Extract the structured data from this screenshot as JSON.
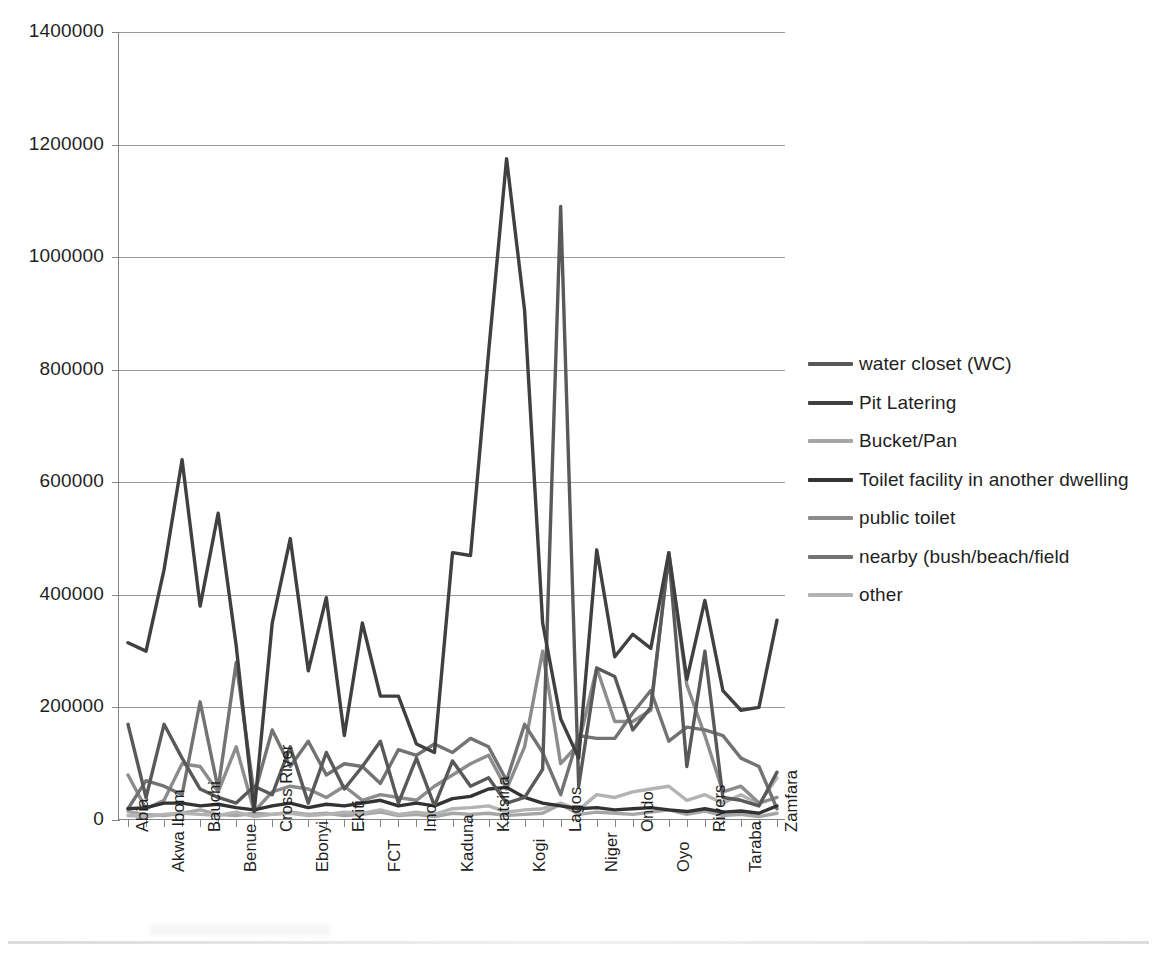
{
  "chart_data": {
    "type": "line",
    "title": "",
    "subtitle": "",
    "xlabel": "",
    "ylabel": "",
    "ylim": [
      0,
      1400000
    ],
    "ytick_labels": [
      "0",
      "200000",
      "400000",
      "600000",
      "800000",
      "1000000",
      "1200000",
      "1400000"
    ],
    "ytick_values": [
      0,
      200000,
      400000,
      600000,
      800000,
      1000000,
      1200000,
      1400000
    ],
    "grid": "horizontal",
    "legend_position": "right",
    "categories": [
      "Abia",
      "Adamawa",
      "Akwa Ibom",
      "Anambra",
      "Bauchi",
      "Bayelsa",
      "Benue",
      "Borno",
      "Cross River",
      "Delta",
      "Ebonyi",
      "Edo",
      "Ekiti",
      "Enugu",
      "FCT",
      "Gombe",
      "Imo",
      "Jigawa",
      "Kaduna",
      "Kano",
      "Katsina",
      "Kebbi",
      "Kogi",
      "Kwara",
      "Lagos",
      "Nasarawa",
      "Niger",
      "Ogun",
      "Ondo",
      "Osun",
      "Oyo",
      "Plateau",
      "Rivers",
      "Sokoto",
      "Taraba",
      "Yobe",
      "Zamfara"
    ],
    "tick_label_categories": [
      "Abia",
      "Akwa Ibom",
      "Bauchi",
      "Benue",
      "Cross River",
      "Ebonyi",
      "Ekiti",
      "FCT",
      "Imo",
      "Kaduna",
      "Katsina",
      "Kogi",
      "Lagos",
      "Niger",
      "Ondo",
      "Oyo",
      "Rivers",
      "Taraba",
      "Zamfara"
    ],
    "series": [
      {
        "name": "water closet (WC)",
        "color": "#595959",
        "values": [
          170000,
          40000,
          170000,
          110000,
          55000,
          40000,
          30000,
          60000,
          45000,
          130000,
          30000,
          120000,
          55000,
          95000,
          140000,
          30000,
          110000,
          25000,
          105000,
          60000,
          75000,
          30000,
          40000,
          90000,
          1090000,
          60000,
          270000,
          255000,
          160000,
          200000,
          470000,
          95000,
          300000,
          40000,
          35000,
          25000,
          85000
        ]
      },
      {
        "name": "Pit Latering",
        "color": "#404040",
        "values": [
          315000,
          300000,
          445000,
          640000,
          380000,
          545000,
          310000,
          15000,
          350000,
          500000,
          265000,
          395000,
          150000,
          350000,
          220000,
          220000,
          135000,
          120000,
          475000,
          470000,
          830000,
          1175000,
          905000,
          350000,
          180000,
          110000,
          480000,
          290000,
          330000,
          305000,
          475000,
          250000,
          390000,
          230000,
          195000,
          200000,
          355000
        ]
      },
      {
        "name": "Bucket/Pan",
        "color": "#a6a6a6",
        "values": [
          15000,
          10000,
          8000,
          12000,
          18000,
          10000,
          8000,
          12000,
          10000,
          14000,
          10000,
          12000,
          8000,
          10000,
          14000,
          8000,
          10000,
          6000,
          12000,
          10000,
          12000,
          8000,
          10000,
          12000,
          28000,
          10000,
          14000,
          12000,
          10000,
          14000,
          18000,
          10000,
          16000,
          8000,
          10000,
          6000,
          12000
        ]
      },
      {
        "name": "Toilet facility in another dwelling",
        "color": "#333333",
        "values": [
          20000,
          22000,
          30000,
          30000,
          25000,
          28000,
          22000,
          18000,
          25000,
          30000,
          22000,
          28000,
          25000,
          30000,
          35000,
          25000,
          30000,
          25000,
          38000,
          42000,
          55000,
          58000,
          40000,
          30000,
          25000,
          20000,
          22000,
          18000,
          20000,
          22000,
          18000,
          15000,
          20000,
          14000,
          16000,
          12000,
          25000
        ]
      },
      {
        "name": "public toilet",
        "color": "#8c8c8c",
        "values": [
          80000,
          20000,
          35000,
          100000,
          95000,
          50000,
          130000,
          15000,
          50000,
          60000,
          55000,
          40000,
          60000,
          35000,
          45000,
          40000,
          35000,
          60000,
          80000,
          100000,
          115000,
          55000,
          130000,
          300000,
          100000,
          135000,
          270000,
          175000,
          175000,
          195000,
          475000,
          240000,
          150000,
          50000,
          60000,
          30000,
          40000
        ]
      },
      {
        "name": "nearby (bush/beach/field",
        "color": "#737373",
        "values": [
          20000,
          70000,
          60000,
          45000,
          210000,
          55000,
          280000,
          45000,
          160000,
          95000,
          140000,
          80000,
          100000,
          95000,
          65000,
          125000,
          115000,
          135000,
          120000,
          145000,
          130000,
          70000,
          170000,
          120000,
          45000,
          150000,
          145000,
          145000,
          190000,
          230000,
          140000,
          165000,
          160000,
          150000,
          110000,
          95000,
          20000
        ]
      },
      {
        "name": "other",
        "color": "#b3b3b3",
        "values": [
          8000,
          6000,
          10000,
          12000,
          10000,
          8000,
          14000,
          6000,
          10000,
          12000,
          8000,
          10000,
          14000,
          12000,
          18000,
          10000,
          14000,
          10000,
          20000,
          22000,
          25000,
          14000,
          18000,
          20000,
          30000,
          18000,
          45000,
          40000,
          50000,
          55000,
          60000,
          35000,
          45000,
          30000,
          45000,
          28000,
          75000
        ]
      }
    ]
  }
}
